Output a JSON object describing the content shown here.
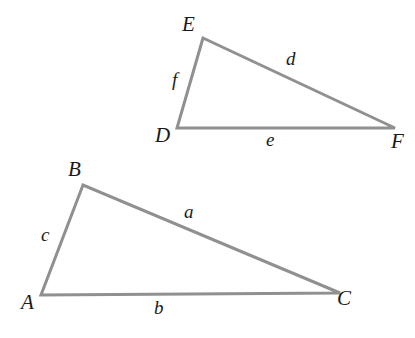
{
  "figure": {
    "type": "geometry-diagram",
    "width": 415,
    "height": 338,
    "background_color": "#ffffff",
    "stroke_color": "#909090",
    "label_color": "#1a1a1a",
    "stroke_width": 3
  },
  "triangles": [
    {
      "id": "upper",
      "name": "triangle-DEF",
      "vertices": [
        {
          "label": "E",
          "x": 203,
          "y": 38
        },
        {
          "label": "D",
          "x": 177,
          "y": 128
        },
        {
          "label": "F",
          "x": 395,
          "y": 128
        }
      ],
      "sides": [
        {
          "label": "d",
          "from": "E",
          "to": "F"
        },
        {
          "label": "e",
          "from": "D",
          "to": "F"
        },
        {
          "label": "f",
          "from": "D",
          "to": "E"
        }
      ]
    },
    {
      "id": "lower",
      "name": "triangle-ABC",
      "vertices": [
        {
          "label": "B",
          "x": 83,
          "y": 185
        },
        {
          "label": "A",
          "x": 41,
          "y": 295
        },
        {
          "label": "C",
          "x": 340,
          "y": 293
        }
      ],
      "sides": [
        {
          "label": "a",
          "from": "B",
          "to": "C"
        },
        {
          "label": "b",
          "from": "A",
          "to": "C"
        },
        {
          "label": "c",
          "from": "A",
          "to": "B"
        }
      ]
    }
  ],
  "labels": {
    "E": "E",
    "D": "D",
    "F": "F",
    "d": "d",
    "e": "e",
    "f": "f",
    "B": "B",
    "A": "A",
    "C": "C",
    "a": "a",
    "b": "b",
    "c": "c"
  },
  "chart_data": {
    "type": "diagram",
    "title": "",
    "shapes": [
      {
        "kind": "triangle",
        "name": "DEF",
        "points": [
          [
            203,
            38
          ],
          [
            177,
            128
          ],
          [
            395,
            128
          ]
        ],
        "vertex_labels": [
          "E",
          "D",
          "F"
        ],
        "side_labels": {
          "EF": "d",
          "DF": "e",
          "DE": "f"
        }
      },
      {
        "kind": "triangle",
        "name": "ABC",
        "points": [
          [
            83,
            185
          ],
          [
            41,
            295
          ],
          [
            340,
            293
          ]
        ],
        "vertex_labels": [
          "B",
          "A",
          "C"
        ],
        "side_labels": {
          "BC": "a",
          "AC": "b",
          "AB": "c"
        }
      }
    ],
    "annotations": [
      "d",
      "e",
      "f",
      "a",
      "b",
      "c"
    ],
    "grid": false,
    "legend": null
  }
}
